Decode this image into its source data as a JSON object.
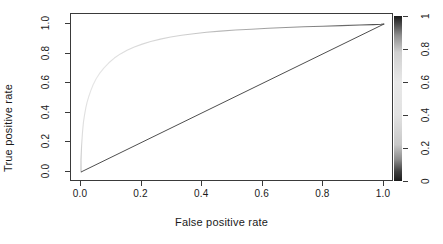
{
  "chart_data": {
    "type": "line",
    "title": "",
    "xlabel": "False positive rate",
    "ylabel": "True positive rate",
    "xlim": [
      0.0,
      1.0
    ],
    "ylim": [
      0.0,
      1.0
    ],
    "grid": false,
    "legend": "colorbar-right",
    "x_ticks": [
      "0.0",
      "0.2",
      "0.4",
      "0.6",
      "0.8",
      "1.0"
    ],
    "x_tick_values": [
      0.0,
      0.2,
      0.4,
      0.6,
      0.8,
      1.0
    ],
    "y_ticks": [
      "0.0",
      "0.2",
      "0.4",
      "0.6",
      "0.8",
      "1.0"
    ],
    "y_tick_values": [
      0.0,
      0.2,
      0.4,
      0.6,
      0.8,
      1.0
    ],
    "colorbar": {
      "label": "",
      "ticks": [
        "0",
        "0.2",
        "0.4",
        "0.6",
        "0.8",
        "1"
      ],
      "tick_values": [
        0.0,
        0.2,
        0.4,
        0.6,
        0.8,
        1.0
      ],
      "orientation": "vertical",
      "position": "right",
      "stops": [
        {
          "at": 0.0,
          "color": "#1a1a1a"
        },
        {
          "at": 0.06,
          "color": "#404040"
        },
        {
          "at": 0.13,
          "color": "#8c8c8c"
        },
        {
          "at": 0.22,
          "color": "#c8c8c8"
        },
        {
          "at": 0.4,
          "color": "#e2e2e2"
        },
        {
          "at": 0.6,
          "color": "#e8e8e8"
        },
        {
          "at": 0.78,
          "color": "#d0d0d0"
        },
        {
          "at": 0.88,
          "color": "#909090"
        },
        {
          "at": 0.95,
          "color": "#4a4a4a"
        },
        {
          "at": 1.0,
          "color": "#1a1a1a"
        }
      ]
    },
    "series": [
      {
        "name": "ROC curve",
        "style": "line",
        "color": "#d9d9d9",
        "x": [
          0.0,
          0.0,
          0.002,
          0.005,
          0.008,
          0.012,
          0.016,
          0.02,
          0.026,
          0.032,
          0.04,
          0.05,
          0.062,
          0.076,
          0.092,
          0.11,
          0.13,
          0.152,
          0.176,
          0.202,
          0.23,
          0.262,
          0.296,
          0.332,
          0.372,
          0.414,
          0.46,
          0.51,
          0.562,
          0.618,
          0.676,
          0.736,
          0.798,
          0.86,
          0.92,
          0.965,
          0.99,
          1.0
        ],
        "y": [
          0.0,
          0.085,
          0.18,
          0.27,
          0.335,
          0.39,
          0.435,
          0.47,
          0.512,
          0.548,
          0.59,
          0.63,
          0.668,
          0.704,
          0.738,
          0.77,
          0.798,
          0.822,
          0.844,
          0.864,
          0.882,
          0.898,
          0.912,
          0.924,
          0.934,
          0.944,
          0.952,
          0.959,
          0.965,
          0.971,
          0.976,
          0.981,
          0.985,
          0.989,
          0.993,
          0.996,
          0.998,
          1.0
        ]
      },
      {
        "name": "Chance diagonal",
        "style": "line",
        "color": "#3a3a3a",
        "x": [
          0.0,
          1.0
        ],
        "y": [
          0.0,
          1.0
        ]
      }
    ]
  },
  "axes": {
    "x_title": "False positive rate",
    "y_title": "True positive rate",
    "x_tick_labels": [
      "0.0",
      "0.2",
      "0.4",
      "0.6",
      "0.8",
      "1.0"
    ],
    "y_tick_labels": [
      "0.0",
      "0.2",
      "0.4",
      "0.6",
      "0.8",
      "1.0"
    ],
    "right_tick_labels": [
      "0",
      "0.2",
      "0.4",
      "0.6",
      "0.8",
      "1"
    ]
  },
  "colors": {
    "axis": "#3a3a3a",
    "text": "#1a1a1a",
    "roc_curve": "#d9d9d9",
    "diagonal": "#3a3a3a",
    "background": "#ffffff"
  }
}
